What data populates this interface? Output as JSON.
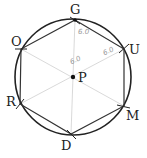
{
  "figure": {
    "type": "regular hexagon inscribed in circle",
    "center": {
      "label": "P"
    },
    "vertices": [
      {
        "label": "G"
      },
      {
        "label": "U"
      },
      {
        "label": "M"
      },
      {
        "label": "D"
      },
      {
        "label": "R"
      },
      {
        "label": "O"
      }
    ],
    "annotations": [
      {
        "text": "6.0"
      },
      {
        "text": "6.0"
      },
      {
        "text": "6.0"
      }
    ],
    "colors": {
      "stroke": "#222222",
      "guide": "#c8c8c8"
    }
  }
}
